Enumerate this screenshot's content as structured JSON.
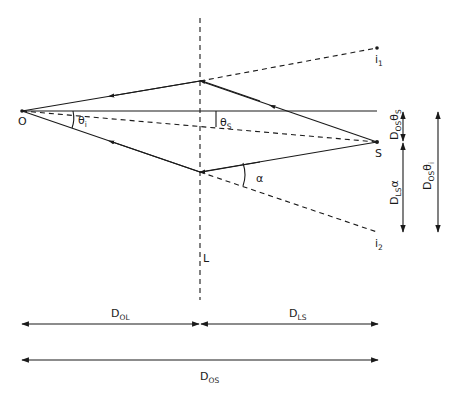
{
  "figure": {
    "points": {
      "observer": {
        "label": "O",
        "x": 22,
        "y": 111
      },
      "source": {
        "label": "S",
        "x": 377,
        "y": 142
      },
      "image1": {
        "label": "i",
        "sub": "1",
        "x": 377,
        "y": 48
      },
      "image2": {
        "label": "i",
        "sub": "2",
        "x": 377,
        "y": 232
      },
      "lens_plane": {
        "label": "L",
        "x": 200
      }
    },
    "angles": {
      "theta_i": {
        "symbol": "θ",
        "sub": "i"
      },
      "theta_s": {
        "symbol": "θ",
        "sub": "S"
      },
      "alpha": {
        "symbol": "α"
      }
    },
    "vertical_measures": [
      {
        "name": "D_OS theta_S",
        "label": "D",
        "sub": "OS",
        "tail": "θ",
        "tail_sub": "S"
      },
      {
        "name": "D_LS alpha",
        "label": "D",
        "sub": "LS",
        "tail": "α",
        "tail_sub": ""
      },
      {
        "name": "D_OS theta_i",
        "label": "D",
        "sub": "OS",
        "tail": "θ",
        "tail_sub": "i"
      }
    ],
    "horizontal_measures": [
      {
        "name": "D_OL",
        "label": "D",
        "sub": "OL"
      },
      {
        "name": "D_LS",
        "label": "D",
        "sub": "LS"
      },
      {
        "name": "D_OS",
        "label": "D",
        "sub": "OS"
      }
    ],
    "colors": {
      "ink": "#1a1a1a",
      "background": "#ffffff"
    }
  }
}
